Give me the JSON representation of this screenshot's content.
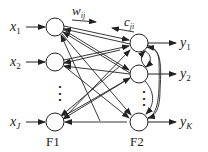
{
  "diagram": {
    "type": "neural-network (ART-like) two-layer F1/F2",
    "layers": [
      {
        "name": "F1",
        "label": "F1",
        "nodes": [
          "x_1",
          "x_2",
          "x_J"
        ]
      },
      {
        "name": "F2",
        "label": "F2",
        "nodes": [
          "y_1",
          "y_2",
          "y_K"
        ]
      }
    ],
    "inputs": [
      {
        "base": "x",
        "sub": "1"
      },
      {
        "base": "x",
        "sub": "2"
      },
      {
        "base": "x",
        "sub": "J"
      }
    ],
    "outputs": [
      {
        "base": "y",
        "sub": "1"
      },
      {
        "base": "y",
        "sub": "2"
      },
      {
        "base": "y",
        "sub": "K"
      }
    ],
    "weights": {
      "bottom_up": {
        "base": "w",
        "sub": "ij"
      },
      "top_down": {
        "base": "c",
        "sub": "ji"
      }
    },
    "ellipsis": "⋮",
    "colors": {
      "stroke": "#222222",
      "background": "#ffffff"
    }
  }
}
